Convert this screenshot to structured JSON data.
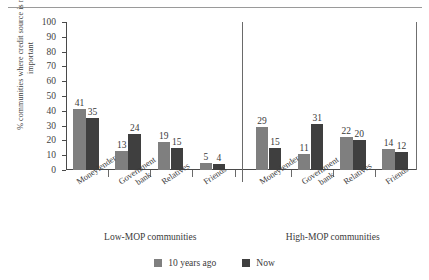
{
  "figure": {
    "top_rule": true,
    "cut_caption": ""
  },
  "legend": {
    "position": "bottom-center",
    "entries": [
      {
        "label": "10 years ago",
        "color": "#7f7f7f",
        "swatch": "series-swatch"
      },
      {
        "label": "Now",
        "color": "#3f3f3f",
        "swatch": "series-swatch"
      }
    ]
  },
  "groups": [
    {
      "title": "Low-MOP communities"
    },
    {
      "title": "High-MOP communities"
    }
  ],
  "chart_data": {
    "type": "bar",
    "title": "",
    "subtitle": "",
    "xlabel": "",
    "ylabel": "% communities where credit source is most important",
    "ylim": [
      0,
      100
    ],
    "ytick_step": 10,
    "yticks": [
      100,
      90,
      80,
      70,
      60,
      50,
      40,
      30,
      20,
      10,
      0
    ],
    "grid": false,
    "legend_position": "bottom-center",
    "group_labels": [
      "Low-MOP communities",
      "High-MOP communities"
    ],
    "categories": [
      "Moneylender",
      "Government bank",
      "Relatives",
      "Friends",
      "Moneylender",
      "Government bank",
      "Relatives",
      "Friends"
    ],
    "category_lines": [
      [
        "Moneylender"
      ],
      [
        "Government",
        "bank"
      ],
      [
        "Relatives"
      ],
      [
        "Friends"
      ],
      [
        "Moneylender"
      ],
      [
        "Government",
        "bank"
      ],
      [
        "Relatives"
      ],
      [
        "Friends"
      ]
    ],
    "category_group": [
      0,
      0,
      0,
      0,
      1,
      1,
      1,
      1
    ],
    "series": [
      {
        "name": "10 years ago",
        "color": "#7f7f7f",
        "values": [
          41,
          13,
          19,
          5,
          29,
          11,
          22,
          14
        ]
      },
      {
        "name": "Now",
        "color": "#3f3f3f",
        "values": [
          35,
          24,
          15,
          4,
          15,
          31,
          20,
          12
        ]
      }
    ]
  }
}
